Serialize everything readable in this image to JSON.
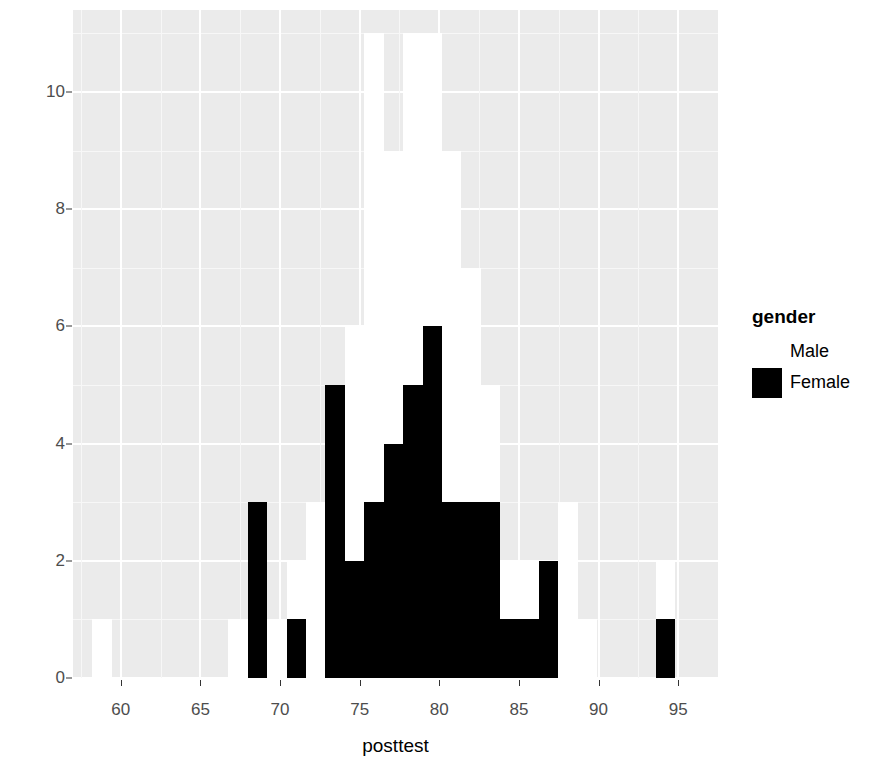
{
  "chart_data": {
    "type": "bar",
    "subtype": "stacked-histogram",
    "title": "",
    "xlabel": "posttest",
    "ylabel": "count",
    "xlim": [
      57.0,
      97.5
    ],
    "ylim": [
      0,
      11.4
    ],
    "xticks": [
      60,
      65,
      70,
      75,
      80,
      85,
      90,
      95
    ],
    "yticks": [
      0,
      2,
      4,
      6,
      8,
      10
    ],
    "grid": true,
    "legend": {
      "title": "gender",
      "position": "right",
      "entries": [
        {
          "label": "Male",
          "color": "#ffffff"
        },
        {
          "label": "Female",
          "color": "#000000"
        }
      ]
    },
    "binwidth": 1.2195,
    "bin_starts": [
      57.0,
      58.22,
      59.44,
      60.66,
      61.88,
      63.09,
      64.31,
      65.53,
      66.75,
      67.97,
      69.19,
      70.41,
      71.63,
      72.85,
      74.07,
      75.29,
      76.51,
      77.73,
      78.95,
      80.17,
      81.39,
      82.61,
      83.83,
      85.04,
      86.26,
      87.48,
      88.7,
      89.92,
      91.14,
      92.36,
      93.58,
      94.8,
      96.02
    ],
    "series": [
      {
        "name": "Female",
        "color": "#000000",
        "values": [
          0,
          0,
          0,
          0,
          0,
          0,
          0,
          0,
          0,
          3,
          0,
          1,
          0,
          5,
          2,
          3,
          4,
          5,
          6,
          3,
          3,
          3,
          1,
          1,
          2,
          0,
          0,
          0,
          0,
          0,
          1,
          0,
          0
        ]
      },
      {
        "name": "Male",
        "color": "#ffffff",
        "values": [
          0,
          1,
          0,
          0,
          0,
          0,
          0,
          0,
          1,
          0,
          1,
          1,
          3,
          0,
          4,
          8,
          5,
          6,
          5,
          6,
          4,
          2,
          1,
          1,
          0,
          3,
          1,
          0,
          0,
          0,
          1,
          0,
          0
        ]
      }
    ],
    "totals": [
      0,
      1,
      0,
      0,
      0,
      0,
      0,
      0,
      1,
      3,
      1,
      2,
      3,
      5,
      6,
      11,
      9,
      11,
      11,
      9,
      7,
      5,
      2,
      2,
      2,
      3,
      1,
      0,
      0,
      0,
      2,
      0,
      0
    ],
    "panel_background": "#ebebeb",
    "gridline_color": "#ffffff"
  },
  "axes": {
    "y_title": "count",
    "x_title": "posttest",
    "y_tick_labels": [
      "0",
      "2",
      "4",
      "6",
      "8",
      "10"
    ],
    "x_tick_labels": [
      "60",
      "65",
      "70",
      "75",
      "80",
      "85",
      "90",
      "95"
    ]
  },
  "legend": {
    "title": "gender",
    "items": [
      {
        "label": "Male"
      },
      {
        "label": "Female"
      }
    ]
  }
}
